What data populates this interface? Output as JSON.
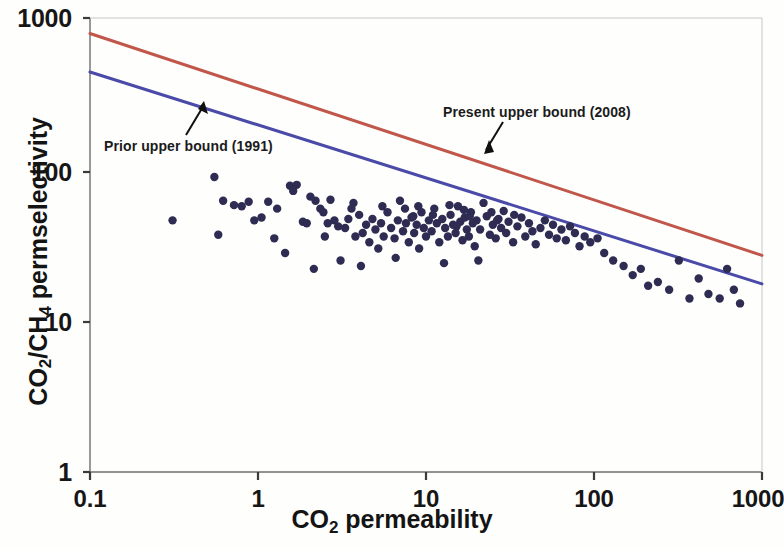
{
  "figure": {
    "background": "#fefefd",
    "point_color": "#2e2c52",
    "prior_bound_color": "#4a4aa8",
    "present_bound_color": "#c0574a",
    "axis_color": "#5a5a5a"
  },
  "annotations": [
    {
      "id": "prior",
      "label": "Prior upper bound (1991)"
    },
    {
      "id": "present",
      "label": "Present upper bound (2008)"
    }
  ],
  "axes": {
    "x": {
      "title_main": "CO",
      "title_sub": "2",
      "title_tail": " permeability",
      "ticks": [
        "0.1",
        "1",
        "10",
        "100",
        "1000"
      ]
    },
    "y": {
      "title_a": "CO",
      "title_a_sub": "2",
      "title_slash": "/CH",
      "title_b_sub": "4",
      "title_tail": " permselectivity",
      "ticks": [
        "1000",
        "100",
        "10",
        "1"
      ]
    }
  },
  "chart_data": {
    "type": "scatter",
    "title": "",
    "xlabel": "CO2 permeability",
    "ylabel": "CO2/CH4 permselectivity",
    "xscale": "log",
    "yscale": "log",
    "xlim": [
      0.1,
      1000
    ],
    "ylim": [
      1,
      1000
    ],
    "xticks": [
      0.1,
      1,
      10,
      100,
      1000
    ],
    "yticks": [
      1,
      10,
      100,
      1000
    ],
    "grid": false,
    "legend": "none (inline annotations with arrows)",
    "series": [
      {
        "name": "Present upper bound (2008)",
        "type": "line",
        "color": "#c0574a",
        "x": [
          0.1,
          1000
        ],
        "y": [
          790,
          27
        ],
        "note": "Robeson 2008 CO2/CH4 upper bound; straight line on log-log axes"
      },
      {
        "name": "Prior upper bound (1991)",
        "type": "line",
        "color": "#4a4aa8",
        "x": [
          0.1,
          1000
        ],
        "y": [
          440,
          17.5
        ],
        "note": "Robeson 1991 CO2/CH4 upper bound; straight line on log-log axes"
      },
      {
        "name": "Polymer membrane data",
        "type": "scatter",
        "color": "#2e2c52",
        "points": [
          [
            0.31,
            46
          ],
          [
            0.55,
            89
          ],
          [
            0.58,
            37
          ],
          [
            0.62,
            62
          ],
          [
            0.72,
            58
          ],
          [
            0.8,
            57
          ],
          [
            0.88,
            61
          ],
          [
            0.95,
            46
          ],
          [
            1.05,
            48
          ],
          [
            1.15,
            61
          ],
          [
            1.3,
            55
          ],
          [
            1.45,
            28
          ],
          [
            1.55,
            78
          ],
          [
            1.62,
            72
          ],
          [
            1.7,
            79
          ],
          [
            1.85,
            45
          ],
          [
            1.95,
            44
          ],
          [
            2.05,
            66
          ],
          [
            2.2,
            62
          ],
          [
            2.35,
            55
          ],
          [
            2.45,
            52
          ],
          [
            2.6,
            44
          ],
          [
            2.7,
            63
          ],
          [
            2.85,
            46
          ],
          [
            3.0,
            42
          ],
          [
            3.1,
            25
          ],
          [
            3.3,
            41
          ],
          [
            3.45,
            47
          ],
          [
            3.6,
            55
          ],
          [
            3.8,
            36
          ],
          [
            4.0,
            50
          ],
          [
            4.2,
            38
          ],
          [
            4.4,
            43
          ],
          [
            4.6,
            33
          ],
          [
            4.8,
            47
          ],
          [
            5.0,
            40
          ],
          [
            5.2,
            30
          ],
          [
            5.4,
            44
          ],
          [
            5.6,
            36
          ],
          [
            5.9,
            52
          ],
          [
            6.2,
            41
          ],
          [
            6.5,
            35
          ],
          [
            6.8,
            46
          ],
          [
            7.0,
            62
          ],
          [
            7.3,
            39
          ],
          [
            7.6,
            44
          ],
          [
            7.9,
            33
          ],
          [
            8.2,
            48
          ],
          [
            8.5,
            38
          ],
          [
            8.8,
            43
          ],
          [
            9.1,
            30
          ],
          [
            9.4,
            52
          ],
          [
            9.7,
            41
          ],
          [
            10.0,
            36
          ],
          [
            10.4,
            46
          ],
          [
            10.8,
            39
          ],
          [
            11.2,
            55
          ],
          [
            11.6,
            44
          ],
          [
            12.0,
            33
          ],
          [
            12.5,
            47
          ],
          [
            13.0,
            41
          ],
          [
            13.5,
            36
          ],
          [
            14.0,
            50
          ],
          [
            14.5,
            43
          ],
          [
            15.0,
            38
          ],
          [
            15.5,
            57
          ],
          [
            16.0,
            45
          ],
          [
            16.5,
            34
          ],
          [
            17.0,
            48
          ],
          [
            17.5,
            40
          ],
          [
            18.0,
            36
          ],
          [
            18.5,
            52
          ],
          [
            19.0,
            44
          ],
          [
            19.5,
            31
          ],
          [
            20.0,
            46
          ],
          [
            21.0,
            40
          ],
          [
            22.0,
            60
          ],
          [
            23.0,
            49
          ],
          [
            24.0,
            37
          ],
          [
            25.0,
            43
          ],
          [
            26.0,
            35
          ],
          [
            27.0,
            47
          ],
          [
            28.0,
            41
          ],
          [
            29.0,
            53
          ],
          [
            30.0,
            38
          ],
          [
            31.0,
            45
          ],
          [
            33.0,
            33
          ],
          [
            35.0,
            42
          ],
          [
            37.0,
            48
          ],
          [
            39.0,
            36
          ],
          [
            41.0,
            44
          ],
          [
            43.0,
            39
          ],
          [
            45.0,
            32
          ],
          [
            48.0,
            41
          ],
          [
            51.0,
            46
          ],
          [
            54.0,
            37
          ],
          [
            57.0,
            43
          ],
          [
            60.0,
            35
          ],
          [
            64.0,
            40
          ],
          [
            68.0,
            34
          ],
          [
            72.0,
            42
          ],
          [
            77.0,
            38
          ],
          [
            82.0,
            31
          ],
          [
            88.0,
            36
          ],
          [
            95.0,
            33
          ],
          [
            105.0,
            35
          ],
          [
            115.0,
            28
          ],
          [
            130.0,
            25
          ],
          [
            150.0,
            23
          ],
          [
            170.0,
            20
          ],
          [
            190.0,
            22
          ],
          [
            210.0,
            17
          ],
          [
            240.0,
            18
          ],
          [
            280.0,
            16
          ],
          [
            320.0,
            25
          ],
          [
            370.0,
            14
          ],
          [
            420.0,
            19
          ],
          [
            480.0,
            15
          ],
          [
            560.0,
            14
          ],
          [
            620.0,
            22
          ],
          [
            680.0,
            16
          ],
          [
            740.0,
            13
          ],
          [
            2.15,
            22
          ],
          [
            4.1,
            23
          ],
          [
            6.6,
            26
          ],
          [
            12.8,
            24
          ],
          [
            20.5,
            25
          ],
          [
            1.25,
            35
          ],
          [
            2.5,
            36
          ],
          [
            5.5,
            57
          ],
          [
            9.0,
            57
          ],
          [
            16.8,
            54
          ],
          [
            24.5,
            52
          ],
          [
            33.5,
            50
          ],
          [
            7.5,
            55
          ],
          [
            11.0,
            50
          ],
          [
            13.8,
            58
          ],
          [
            18.2,
            49
          ],
          [
            26.5,
            46
          ],
          [
            3.7,
            60
          ],
          [
            8.4,
            49
          ],
          [
            15.2,
            42
          ]
        ]
      }
    ]
  }
}
